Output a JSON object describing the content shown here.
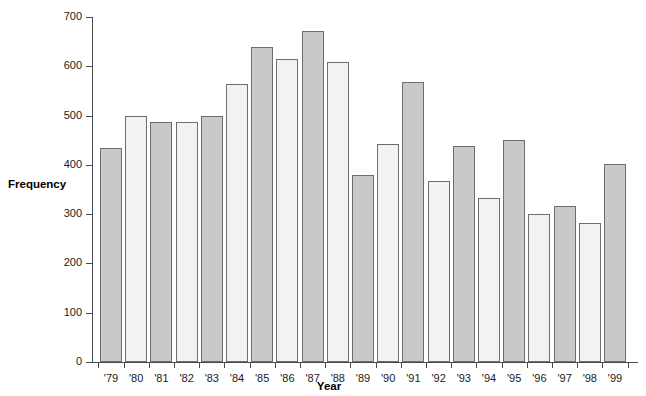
{
  "chart_data": {
    "type": "bar",
    "title": "",
    "xlabel": "Year",
    "ylabel": "Frequency",
    "categories": [
      "'79",
      "'80",
      "'81",
      "'82",
      "'83",
      "'84",
      "'85",
      "'86",
      "'87",
      "'88",
      "'89",
      "'90",
      "'91",
      "'92",
      "'93",
      "'94",
      "'95",
      "'96",
      "'97",
      "'98",
      "'99"
    ],
    "values": [
      435,
      500,
      488,
      488,
      500,
      565,
      640,
      615,
      672,
      608,
      380,
      443,
      568,
      367,
      438,
      332,
      450,
      300,
      317,
      283,
      402
    ],
    "ylim": [
      0,
      700
    ],
    "yticks": [
      0,
      100,
      200,
      300,
      400,
      500,
      600,
      700
    ],
    "ytick_labels": [
      "0",
      "100",
      "200",
      "300",
      "400",
      "500",
      "600",
      "700"
    ],
    "grid": false,
    "legend": null,
    "bar_colors": [
      "#c9c9c9",
      "#f2f2f2"
    ],
    "bar_border_color": "#6e6e6e",
    "axis_color": "#4a4a4a",
    "series": [
      {
        "name": "Frequency",
        "values": [
          435,
          500,
          488,
          488,
          500,
          565,
          640,
          615,
          672,
          608,
          380,
          443,
          568,
          367,
          438,
          332,
          450,
          300,
          317,
          283,
          402
        ]
      }
    ]
  },
  "labels": {
    "y_axis_title": "Frequency",
    "x_axis_title": "Year"
  }
}
